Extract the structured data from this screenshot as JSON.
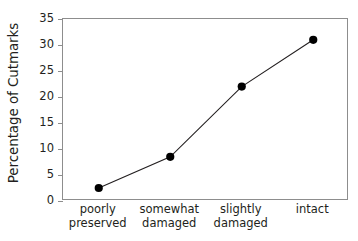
{
  "chart_data": {
    "type": "line",
    "title": "",
    "xlabel": "",
    "ylabel": "Percentage of Cutmarks",
    "categories": [
      "poorly preserved",
      "somewhat damaged",
      "slightly damaged",
      "intact"
    ],
    "category_lines": [
      [
        "poorly",
        "preserved"
      ],
      [
        "somewhat",
        "damaged"
      ],
      [
        "slightly",
        "damaged"
      ],
      [
        "intact"
      ]
    ],
    "values": [
      2.5,
      8.5,
      22,
      31
    ],
    "ylim": [
      0,
      35
    ],
    "yticks": [
      0,
      5,
      10,
      15,
      20,
      25,
      30,
      35
    ],
    "ytick_labels": [
      "0",
      "5",
      "10",
      "15",
      "20",
      "25",
      "30",
      "35"
    ],
    "grid": false,
    "legend": false,
    "marker": "filled-circle",
    "line_color": "#231f20",
    "marker_color": "#000000",
    "axis_color": "#8d8d8d",
    "background_color": "#ffffff"
  }
}
